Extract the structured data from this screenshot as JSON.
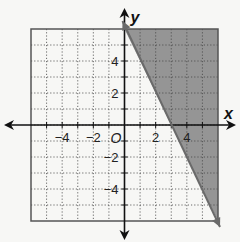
{
  "chart_data": {
    "type": "area",
    "title": "",
    "xlabel": "x",
    "ylabel": "y",
    "origin_label": "O",
    "xlim": [
      -6,
      6
    ],
    "ylim": [
      -6,
      6
    ],
    "grid": true,
    "grid_style": "dotted",
    "x_ticks": [
      -4,
      -2,
      2,
      4
    ],
    "y_ticks": [
      4,
      2,
      -2,
      -4
    ],
    "x_tick_labels": [
      "−4",
      "−2",
      "2",
      "4"
    ],
    "y_tick_labels": [
      "4",
      "2",
      "−2",
      "−4"
    ],
    "boundary_line": {
      "equation": "y = -2x + 6",
      "slope": -2,
      "y_intercept": 6,
      "x_intercept": 3,
      "style": "solid",
      "points": [
        [
          0,
          6
        ],
        [
          6,
          -6
        ]
      ]
    },
    "shaded_region": "y >= -2x + 6",
    "shade_color": "#8f8f8f"
  },
  "colors": {
    "background": "#f7f7f5",
    "grid_box": "#555555",
    "axis": "#111111",
    "shade": "#8f8f8f",
    "line": "#6a6a6a"
  }
}
